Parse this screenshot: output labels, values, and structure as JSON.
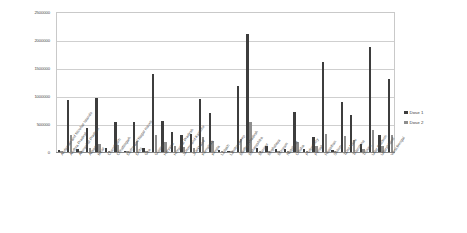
{
  "chart_data": {
    "type": "bar",
    "title": "",
    "xlabel": "",
    "ylabel": "",
    "ylim": [
      0,
      2500000
    ],
    "grid": true,
    "legend_position": "right",
    "yticks": [
      "2500000",
      "2000000",
      "1500000",
      "1000000",
      "500000",
      "0"
    ],
    "ytick_values": [
      2500000,
      2000000,
      1500000,
      1000000,
      500000,
      0
    ],
    "categories": [
      "Andaman and Nicobar Islands",
      "Andhra Pradesh",
      "Arunachal Pradesh",
      "Assam",
      "Bihar",
      "Chandigarh",
      "Chhattisgarh",
      "Dadra and Nagar Haveli",
      "Delhi",
      "Goa",
      "Gujarat",
      "Haryana",
      "Himachal Pradesh",
      "Jammu and Kashmir",
      "Jharkhand",
      "Karnataka",
      "Kerala",
      "Ladakh",
      "Lakshadweep",
      "Madhya Pradesh",
      "Maharashtra",
      "Manipur",
      "Meghalaya",
      "Mizoram",
      "Nagaland",
      "Odisha",
      "Puducherry",
      "Punjab",
      "Rajasthan",
      "Sikkim",
      "Tamil Nadu",
      "Telangana",
      "Tripura",
      "Uttar Pradesh",
      "Uttarakhand",
      "West Bengal"
    ],
    "series": [
      {
        "name": "Dose 1",
        "color": "#3d3d3d",
        "values": [
          30000,
          920000,
          60000,
          430000,
          960000,
          70000,
          530000,
          20000,
          530000,
          70000,
          1390000,
          560000,
          350000,
          300000,
          330000,
          940000,
          690000,
          40000,
          10000,
          1170000,
          2110000,
          70000,
          100000,
          60000,
          50000,
          720000,
          50000,
          270000,
          1610000,
          40000,
          890000,
          660000,
          140000,
          1880000,
          300000,
          1310000
        ]
      },
      {
        "name": "Dose 2",
        "color": "#8e8e8e",
        "values": [
          8000,
          300000,
          15000,
          70000,
          140000,
          25000,
          120000,
          5000,
          190000,
          25000,
          300000,
          170000,
          100000,
          90000,
          80000,
          260000,
          200000,
          12000,
          4000,
          240000,
          530000,
          20000,
          25000,
          18000,
          15000,
          170000,
          18000,
          100000,
          330000,
          12000,
          280000,
          210000,
          60000,
          390000,
          110000,
          300000
        ]
      }
    ]
  },
  "legend": {
    "items": [
      {
        "label": "Dose 1",
        "color": "#3d3d3d"
      },
      {
        "label": "Dose 2",
        "color": "#8e8e8e"
      }
    ]
  }
}
